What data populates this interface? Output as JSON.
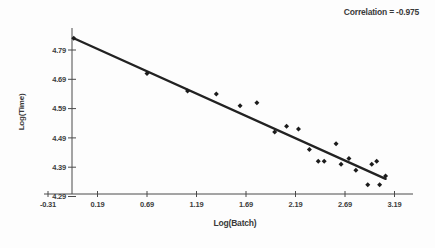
{
  "chart_data": {
    "type": "scatter",
    "title": "",
    "annotation": "Correlation = -0.975",
    "correlation": -0.975,
    "xlabel": "Log(Batch)",
    "ylabel": "Log(Time)",
    "x_tick_labels": [
      "-0.31",
      "0.19",
      "0.69",
      "1.19",
      "1.69",
      "2.19",
      "2.69",
      "3.19"
    ],
    "y_tick_labels": [
      "4.79",
      "4.69",
      "4.59",
      "4.49",
      "4.39",
      "4.29"
    ],
    "xlim": [
      -0.31,
      3.44
    ],
    "ylim": [
      4.29,
      4.86
    ],
    "grid": false,
    "legend": null,
    "points": [
      [
        -0.05,
        4.83
      ],
      [
        0.69,
        4.71
      ],
      [
        1.1,
        4.65
      ],
      [
        1.39,
        4.64
      ],
      [
        1.63,
        4.6
      ],
      [
        1.8,
        4.61
      ],
      [
        1.98,
        4.51
      ],
      [
        2.1,
        4.53
      ],
      [
        2.22,
        4.52
      ],
      [
        2.33,
        4.45
      ],
      [
        2.42,
        4.41
      ],
      [
        2.48,
        4.41
      ],
      [
        2.6,
        4.47
      ],
      [
        2.65,
        4.4
      ],
      [
        2.73,
        4.42
      ],
      [
        2.8,
        4.38
      ],
      [
        2.92,
        4.33
      ],
      [
        2.96,
        4.4
      ],
      [
        3.01,
        4.41
      ],
      [
        3.04,
        4.33
      ],
      [
        3.1,
        4.36
      ]
    ],
    "trendline": {
      "x1": -0.05,
      "y1": 4.83,
      "x2": 3.1,
      "y2": 4.35
    },
    "colors": {
      "points": "#1c1c1c",
      "trend_line": "#222222",
      "axis": "#4a4a4a",
      "text": "#3c3c3c",
      "background": "#fdfdfd"
    }
  }
}
